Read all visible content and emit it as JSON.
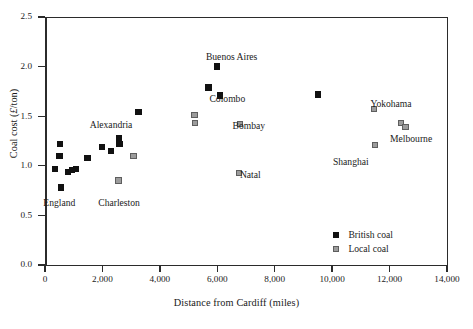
{
  "chart_data": {
    "type": "scatter",
    "title": "",
    "xlabel": "Distance from Cardiff (miles)",
    "ylabel": "Coal cost (£/ton)",
    "ylabel_prefix": "Coal cost (",
    "ylabel_pound": "£",
    "ylabel_suffix": "/ton)",
    "xlim": [
      0,
      14000
    ],
    "ylim": [
      0.0,
      2.5
    ],
    "xticks": [
      0,
      2000,
      4000,
      6000,
      8000,
      10000,
      12000,
      14000
    ],
    "xtick_labels": [
      "0",
      "2,000",
      "4,000",
      "6,000",
      "8,000",
      "10,000",
      "12,000",
      "14,000"
    ],
    "yticks": [
      0.0,
      0.5,
      1.0,
      1.5,
      2.0,
      2.5
    ],
    "ytick_labels": [
      "0.0",
      "0.5",
      "1.0",
      "1.5",
      "2.0",
      "2.5"
    ],
    "grid": false,
    "legend_position": "lower-right",
    "series": [
      {
        "name": "British coal",
        "key": "british",
        "color": "#111111",
        "marker": "square-filled",
        "points": [
          {
            "x": 350,
            "y": 0.97
          },
          {
            "x": 500,
            "y": 1.1
          },
          {
            "x": 520,
            "y": 1.22
          },
          {
            "x": 560,
            "y": 0.78
          },
          {
            "x": 800,
            "y": 0.94
          },
          {
            "x": 950,
            "y": 0.96
          },
          {
            "x": 1080,
            "y": 0.97
          },
          {
            "x": 1480,
            "y": 1.08
          },
          {
            "x": 1980,
            "y": 1.19
          },
          {
            "x": 2300,
            "y": 1.15
          },
          {
            "x": 2580,
            "y": 1.28
          },
          {
            "x": 2600,
            "y": 1.22
          },
          {
            "x": 3250,
            "y": 1.54
          },
          {
            "x": 5700,
            "y": 1.79
          },
          {
            "x": 6000,
            "y": 2.0
          },
          {
            "x": 6100,
            "y": 1.71
          },
          {
            "x": 9500,
            "y": 1.72
          }
        ]
      },
      {
        "name": "Local coal",
        "key": "local",
        "color": "#9c9c9c",
        "marker": "square-filled-outlined",
        "points": [
          {
            "x": 2560,
            "y": 0.85
          },
          {
            "x": 3080,
            "y": 1.1
          },
          {
            "x": 5200,
            "y": 1.51
          },
          {
            "x": 5220,
            "y": 1.43
          },
          {
            "x": 6750,
            "y": 0.93
          },
          {
            "x": 6800,
            "y": 1.42
          },
          {
            "x": 11450,
            "y": 1.57
          },
          {
            "x": 11500,
            "y": 1.21
          },
          {
            "x": 12400,
            "y": 1.43
          },
          {
            "x": 12550,
            "y": 1.39
          }
        ]
      }
    ],
    "annotations": [
      {
        "text": "England",
        "x": 500,
        "y": 0.63
      },
      {
        "text": "Charleston",
        "x": 2580,
        "y": 0.63
      },
      {
        "text": "Alexandria",
        "x": 2300,
        "y": 1.41
      },
      {
        "text": "Buenos Aires",
        "x": 6500,
        "y": 2.1
      },
      {
        "text": "Colombo",
        "x": 6350,
        "y": 1.67
      },
      {
        "text": "Bombay",
        "x": 7100,
        "y": 1.4
      },
      {
        "text": "Natal",
        "x": 7150,
        "y": 0.91
      },
      {
        "text": "Shanghai",
        "x": 10650,
        "y": 1.04
      },
      {
        "text": "Yokohama",
        "x": 12050,
        "y": 1.62
      },
      {
        "text": "Melbourne",
        "x": 12750,
        "y": 1.27
      }
    ]
  },
  "legend": {
    "items": [
      {
        "label": "British coal",
        "key": "british"
      },
      {
        "label": "Local coal",
        "key": "local"
      }
    ]
  }
}
